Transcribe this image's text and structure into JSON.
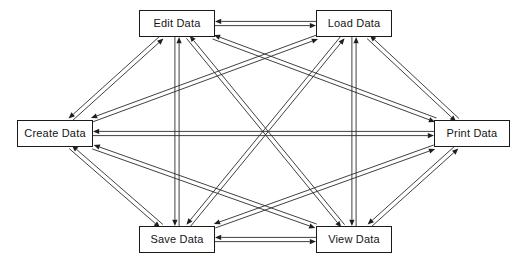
{
  "diagram": {
    "type": "directed-graph",
    "background_color": "#ffffff",
    "line_color": "#2b2b2b",
    "box_border_color": "#1a1a1a",
    "box_fill_color": "#ffffff",
    "text_color": "#141414",
    "canvas": {
      "width": 523,
      "height": 264
    },
    "nodes": [
      {
        "id": "create",
        "label": "Create Data",
        "x": 17,
        "y": 120,
        "w": 76,
        "h": 27
      },
      {
        "id": "edit",
        "label": "Edit Data",
        "x": 139,
        "y": 10,
        "w": 76,
        "h": 27
      },
      {
        "id": "load",
        "label": "Load Data",
        "x": 316,
        "y": 10,
        "w": 76,
        "h": 27
      },
      {
        "id": "print",
        "label": "Print Data",
        "x": 434,
        "y": 120,
        "w": 76,
        "h": 27
      },
      {
        "id": "view",
        "label": "View Data",
        "x": 316,
        "y": 226,
        "w": 76,
        "h": 27
      },
      {
        "id": "save",
        "label": "Save Data",
        "x": 139,
        "y": 226,
        "w": 76,
        "h": 27
      }
    ],
    "edges": [
      {
        "from": "create",
        "to": "edit",
        "bidirectional": true
      },
      {
        "from": "create",
        "to": "load",
        "bidirectional": true
      },
      {
        "from": "create",
        "to": "print",
        "bidirectional": true
      },
      {
        "from": "create",
        "to": "view",
        "bidirectional": true
      },
      {
        "from": "create",
        "to": "save",
        "bidirectional": true
      },
      {
        "from": "edit",
        "to": "load",
        "bidirectional": true
      },
      {
        "from": "edit",
        "to": "print",
        "bidirectional": true
      },
      {
        "from": "edit",
        "to": "view",
        "bidirectional": true
      },
      {
        "from": "edit",
        "to": "save",
        "bidirectional": true
      },
      {
        "from": "load",
        "to": "print",
        "bidirectional": true
      },
      {
        "from": "load",
        "to": "view",
        "bidirectional": true
      },
      {
        "from": "load",
        "to": "save",
        "bidirectional": true
      },
      {
        "from": "print",
        "to": "view",
        "bidirectional": true
      },
      {
        "from": "print",
        "to": "save",
        "bidirectional": true
      },
      {
        "from": "view",
        "to": "save",
        "bidirectional": true
      }
    ],
    "edge_count": 15,
    "node_count": 6,
    "fully_connected": true
  }
}
